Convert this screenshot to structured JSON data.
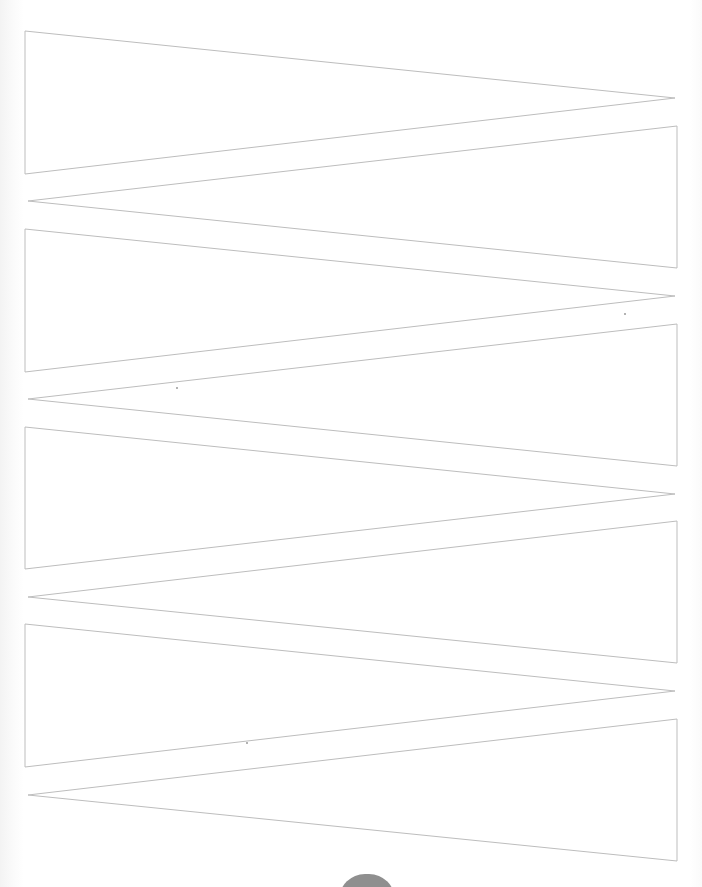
{
  "page": {
    "type": "printable cut-out template"
  },
  "template": {
    "stroke_color": "#bdbdbd",
    "fill_color": "#ffffff",
    "shapes": [
      {
        "id": "pennant-1",
        "orientation": "base-left",
        "points": "25,31 25,174 675,98"
      },
      {
        "id": "pennant-2",
        "orientation": "base-right",
        "points": "677,126 677,268 28,201"
      },
      {
        "id": "pennant-3",
        "orientation": "base-left",
        "points": "25,229 25,372 675,296"
      },
      {
        "id": "pennant-4",
        "orientation": "base-right",
        "points": "677,324 677,466 28,399"
      },
      {
        "id": "pennant-5",
        "orientation": "base-left",
        "points": "25,427 25,569 675,494"
      },
      {
        "id": "pennant-6",
        "orientation": "base-right",
        "points": "677,521 677,663 28,597"
      },
      {
        "id": "pennant-7",
        "orientation": "base-left",
        "points": "25,624 25,767 675,691"
      },
      {
        "id": "pennant-8",
        "orientation": "base-right",
        "points": "677,719 677,861 28,795"
      }
    ]
  },
  "bottom_marker": {
    "shape": "pill",
    "color": "#8f8f8f"
  }
}
